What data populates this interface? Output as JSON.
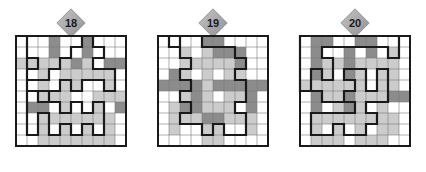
{
  "page": {
    "kind": "puzzle-sheet",
    "puzzle_count": 3,
    "background_color": "#ffffff"
  },
  "palette": {
    "cell_white": "#ffffff",
    "cell_light": "#cccccc",
    "cell_dark": "#8c8c8c",
    "gridline": "#7a7a7a",
    "border": "#1a1a1a",
    "loop": "#1a1a1a",
    "badge_fill": "#a8a8a8",
    "badge_edge": "#8a8a8a",
    "badge_text": "#1a1a1a"
  },
  "geometry": {
    "cell_size": 11,
    "grid_cols": 10,
    "grid_rows": 10,
    "grid_pixel_size": 110,
    "border_width": 2,
    "gridline_width": 0.6,
    "loop_width": 2.2
  },
  "puzzles": [
    {
      "id": "puzzle-18",
      "badge_label": "18",
      "cols": 10,
      "rows": 10,
      "shading": [
        [
          0,
          0,
          0,
          2,
          0,
          0,
          2,
          0,
          0,
          0
        ],
        [
          0,
          0,
          0,
          2,
          0,
          0,
          2,
          0,
          0,
          0
        ],
        [
          1,
          1,
          1,
          1,
          1,
          2,
          1,
          0,
          2,
          2
        ],
        [
          0,
          0,
          1,
          0,
          1,
          1,
          1,
          1,
          1,
          0
        ],
        [
          0,
          0,
          1,
          0,
          1,
          1,
          0,
          0,
          1,
          0
        ],
        [
          0,
          0,
          1,
          1,
          1,
          0,
          0,
          1,
          1,
          1
        ],
        [
          0,
          2,
          2,
          0,
          1,
          0,
          0,
          1,
          0,
          2
        ],
        [
          0,
          0,
          1,
          1,
          1,
          1,
          1,
          1,
          1,
          0
        ],
        [
          0,
          0,
          1,
          0,
          1,
          0,
          1,
          0,
          1,
          0
        ],
        [
          0,
          0,
          1,
          1,
          1,
          1,
          1,
          1,
          1,
          0
        ]
      ],
      "loop_points": [
        [
          1,
          0
        ],
        [
          1,
          2
        ],
        [
          2,
          2
        ],
        [
          2,
          3
        ],
        [
          1,
          3
        ],
        [
          1,
          4
        ],
        [
          3,
          4
        ],
        [
          3,
          3
        ],
        [
          4,
          3
        ],
        [
          4,
          2
        ],
        [
          5,
          2
        ],
        [
          5,
          1
        ],
        [
          6,
          1
        ],
        [
          6,
          0
        ],
        [
          7,
          0
        ],
        [
          7,
          1
        ],
        [
          8,
          1
        ],
        [
          8,
          2
        ],
        [
          7,
          2
        ],
        [
          7,
          3
        ],
        [
          9,
          3
        ],
        [
          9,
          5
        ],
        [
          8,
          5
        ],
        [
          8,
          4
        ],
        [
          6,
          4
        ],
        [
          6,
          5
        ],
        [
          5,
          5
        ],
        [
          5,
          4
        ],
        [
          4,
          4
        ],
        [
          4,
          5
        ],
        [
          3,
          5
        ],
        [
          3,
          6
        ],
        [
          2,
          6
        ],
        [
          2,
          5
        ],
        [
          1,
          5
        ],
        [
          1,
          9
        ],
        [
          2,
          9
        ],
        [
          2,
          7
        ],
        [
          3,
          7
        ],
        [
          3,
          9
        ],
        [
          4,
          9
        ],
        [
          4,
          8
        ],
        [
          5,
          8
        ],
        [
          5,
          9
        ],
        [
          6,
          9
        ],
        [
          6,
          8
        ],
        [
          7,
          8
        ],
        [
          7,
          9
        ],
        [
          8,
          9
        ],
        [
          8,
          6
        ],
        [
          7,
          6
        ],
        [
          7,
          7
        ],
        [
          6,
          7
        ],
        [
          6,
          6
        ],
        [
          5,
          6
        ],
        [
          5,
          7
        ],
        [
          4,
          7
        ],
        [
          4,
          6
        ],
        [
          3,
          6
        ],
        [
          3,
          5
        ],
        [
          1,
          5
        ],
        [
          1,
          4
        ],
        [
          1,
          0
        ]
      ]
    },
    {
      "id": "puzzle-19",
      "badge_label": "19",
      "cols": 10,
      "rows": 10,
      "shading": [
        [
          0,
          0,
          0,
          0,
          2,
          2,
          0,
          0,
          0,
          0
        ],
        [
          0,
          0,
          1,
          0,
          1,
          2,
          2,
          2,
          0,
          0
        ],
        [
          0,
          0,
          1,
          1,
          1,
          1,
          1,
          2,
          0,
          0
        ],
        [
          0,
          2,
          1,
          0,
          1,
          0,
          1,
          1,
          0,
          0
        ],
        [
          2,
          2,
          2,
          2,
          1,
          2,
          2,
          2,
          2,
          2
        ],
        [
          0,
          0,
          1,
          2,
          1,
          0,
          1,
          1,
          2,
          0
        ],
        [
          0,
          1,
          2,
          2,
          1,
          1,
          1,
          0,
          2,
          0
        ],
        [
          0,
          1,
          1,
          1,
          2,
          2,
          1,
          1,
          1,
          0
        ],
        [
          0,
          1,
          0,
          0,
          1,
          1,
          0,
          0,
          1,
          0
        ],
        [
          0,
          0,
          0,
          0,
          1,
          1,
          0,
          0,
          0,
          0
        ]
      ],
      "loop_points": [
        [
          1,
          0
        ],
        [
          1,
          1
        ],
        [
          2,
          1
        ],
        [
          2,
          0
        ],
        [
          4,
          0
        ],
        [
          4,
          1
        ],
        [
          7,
          1
        ],
        [
          7,
          2
        ],
        [
          8,
          2
        ],
        [
          8,
          3
        ],
        [
          7,
          3
        ],
        [
          7,
          4
        ],
        [
          8,
          4
        ],
        [
          8,
          6
        ],
        [
          7,
          6
        ],
        [
          7,
          7
        ],
        [
          8,
          7
        ],
        [
          8,
          9
        ],
        [
          6,
          9
        ],
        [
          6,
          8
        ],
        [
          5,
          8
        ],
        [
          5,
          9
        ],
        [
          4,
          9
        ],
        [
          4,
          8
        ],
        [
          2,
          8
        ],
        [
          2,
          7
        ],
        [
          3,
          7
        ],
        [
          3,
          6
        ],
        [
          2,
          6
        ],
        [
          2,
          5
        ],
        [
          3,
          5
        ],
        [
          3,
          4
        ],
        [
          2,
          4
        ],
        [
          2,
          3
        ],
        [
          3,
          3
        ],
        [
          3,
          2
        ],
        [
          2,
          2
        ],
        [
          2,
          1
        ],
        [
          1,
          1
        ],
        [
          1,
          0
        ]
      ]
    },
    {
      "id": "puzzle-20",
      "badge_label": "20",
      "cols": 10,
      "rows": 10,
      "shading": [
        [
          0,
          2,
          2,
          0,
          0,
          2,
          2,
          0,
          0,
          0
        ],
        [
          0,
          2,
          0,
          0,
          2,
          0,
          2,
          0,
          1,
          0
        ],
        [
          0,
          2,
          1,
          1,
          2,
          1,
          1,
          1,
          1,
          0
        ],
        [
          0,
          2,
          1,
          0,
          2,
          1,
          0,
          1,
          1,
          0
        ],
        [
          1,
          1,
          1,
          1,
          1,
          1,
          0,
          1,
          1,
          0
        ],
        [
          0,
          2,
          1,
          1,
          2,
          1,
          1,
          1,
          2,
          2
        ],
        [
          0,
          2,
          0,
          1,
          2,
          1,
          0,
          1,
          0,
          0
        ],
        [
          0,
          1,
          1,
          1,
          1,
          1,
          1,
          1,
          1,
          0
        ],
        [
          0,
          1,
          0,
          1,
          0,
          1,
          0,
          1,
          1,
          0
        ],
        [
          0,
          1,
          1,
          1,
          0,
          1,
          1,
          1,
          0,
          0
        ]
      ],
      "loop_points": [
        [
          0,
          1
        ],
        [
          0,
          0
        ],
        [
          9,
          0
        ],
        [
          9,
          2
        ],
        [
          8,
          2
        ],
        [
          8,
          1
        ],
        [
          2,
          1
        ],
        [
          2,
          2
        ],
        [
          3,
          2
        ],
        [
          3,
          4
        ],
        [
          2,
          4
        ],
        [
          2,
          3
        ],
        [
          1,
          3
        ],
        [
          1,
          5
        ],
        [
          2,
          5
        ],
        [
          2,
          6
        ],
        [
          4,
          6
        ],
        [
          4,
          5
        ],
        [
          5,
          5
        ],
        [
          5,
          4
        ],
        [
          4,
          4
        ],
        [
          4,
          3
        ],
        [
          6,
          3
        ],
        [
          6,
          5
        ],
        [
          7,
          5
        ],
        [
          7,
          3
        ],
        [
          8,
          3
        ],
        [
          8,
          6
        ],
        [
          6,
          6
        ],
        [
          6,
          7
        ],
        [
          7,
          7
        ],
        [
          7,
          8
        ],
        [
          6,
          8
        ],
        [
          6,
          9
        ],
        [
          4,
          9
        ],
        [
          4,
          8
        ],
        [
          3,
          8
        ],
        [
          3,
          9
        ],
        [
          1,
          9
        ],
        [
          1,
          7
        ],
        [
          5,
          7
        ],
        [
          5,
          6
        ],
        [
          2,
          6
        ],
        [
          2,
          5
        ],
        [
          0,
          5
        ],
        [
          0,
          1
        ]
      ]
    }
  ]
}
